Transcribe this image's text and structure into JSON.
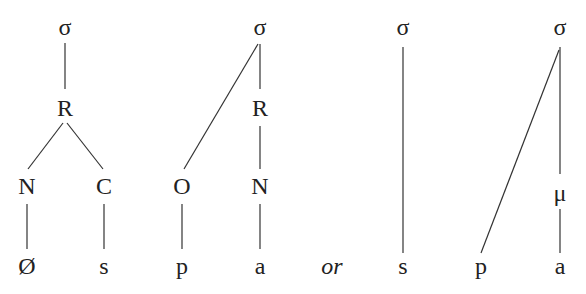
{
  "diagram": {
    "type": "syllable-structure-trees",
    "trees": [
      {
        "id": "tree1",
        "nodes": [
          {
            "id": "sigma",
            "label": "σ",
            "x": 65,
            "y": 27
          },
          {
            "id": "R",
            "label": "R",
            "x": 65,
            "y": 108
          },
          {
            "id": "N",
            "label": "N",
            "x": 27,
            "y": 186
          },
          {
            "id": "C",
            "label": "C",
            "x": 104,
            "y": 186
          },
          {
            "id": "null",
            "label": "Ø",
            "x": 27,
            "y": 266
          },
          {
            "id": "s",
            "label": "s",
            "x": 104,
            "y": 266
          }
        ],
        "edges": [
          [
            "sigma",
            "R"
          ],
          [
            "R",
            "N"
          ],
          [
            "R",
            "C"
          ],
          [
            "N",
            "null"
          ],
          [
            "C",
            "s"
          ]
        ]
      },
      {
        "id": "tree2",
        "nodes": [
          {
            "id": "sigma",
            "label": "σ",
            "x": 260,
            "y": 27
          },
          {
            "id": "R",
            "label": "R",
            "x": 260,
            "y": 108
          },
          {
            "id": "O",
            "label": "O",
            "x": 182,
            "y": 186
          },
          {
            "id": "N",
            "label": "N",
            "x": 260,
            "y": 186
          },
          {
            "id": "p",
            "label": "p",
            "x": 182,
            "y": 266
          },
          {
            "id": "a",
            "label": "a",
            "x": 260,
            "y": 266
          }
        ],
        "edges": [
          [
            "sigma",
            "O"
          ],
          [
            "sigma",
            "R"
          ],
          [
            "R",
            "N"
          ],
          [
            "O",
            "p"
          ],
          [
            "N",
            "a"
          ]
        ]
      },
      {
        "id": "tree3",
        "nodes": [
          {
            "id": "sigma",
            "label": "σ",
            "x": 403,
            "y": 27
          },
          {
            "id": "s",
            "label": "s",
            "x": 403,
            "y": 266
          }
        ],
        "edges": [
          [
            "sigma",
            "s"
          ]
        ]
      },
      {
        "id": "tree4",
        "nodes": [
          {
            "id": "sigma",
            "label": "σ",
            "x": 560,
            "y": 27
          },
          {
            "id": "mu",
            "label": "μ",
            "x": 560,
            "y": 193
          },
          {
            "id": "p",
            "label": "p",
            "x": 481,
            "y": 266
          },
          {
            "id": "a",
            "label": "a",
            "x": 560,
            "y": 266
          }
        ],
        "edges": [
          [
            "sigma",
            "mu"
          ],
          [
            "sigma",
            "p"
          ],
          [
            "mu",
            "a"
          ]
        ]
      }
    ],
    "connector": {
      "label": "or",
      "x": 332,
      "y": 266
    }
  },
  "labels": {
    "t1_sigma": "σ",
    "t1_R": "R",
    "t1_N": "N",
    "t1_C": "C",
    "t1_null": "Ø",
    "t1_s": "s",
    "t2_sigma": "σ",
    "t2_R": "R",
    "t2_O": "O",
    "t2_N": "N",
    "t2_p": "p",
    "t2_a": "a",
    "or": "or",
    "t3_sigma": "σ",
    "t3_s": "s",
    "t4_sigma": "σ",
    "t4_mu": "μ",
    "t4_p": "p",
    "t4_a": "a"
  },
  "colors": {
    "line": "#333333",
    "text": "#222222",
    "background": "#ffffff"
  }
}
